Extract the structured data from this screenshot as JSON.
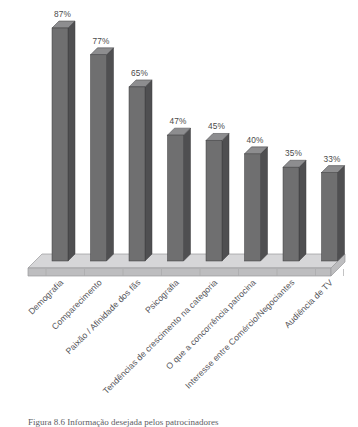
{
  "chart_data": {
    "type": "bar",
    "title": "",
    "subtitle": "",
    "xlabel": "",
    "ylabel": "",
    "ylim": [
      0,
      100
    ],
    "grid": false,
    "legend": false,
    "value_suffix": "%",
    "style": "3d-column",
    "categories": [
      "Demografia",
      "Comparecimento",
      "Paixão / Afinidade dos fãs",
      "Psicografia",
      "Tendências de crescimento na categoria",
      "O que a concorrência patrocina",
      "Interesse entre Comércio/Negociantes",
      "Audiência de TV"
    ],
    "values": [
      87,
      77,
      65,
      47,
      45,
      40,
      35,
      33
    ],
    "value_labels": [
      "87%",
      "77%",
      "65%",
      "47%",
      "45%",
      "40%",
      "35%",
      "33%"
    ],
    "colors": {
      "bar_front": "#6f6f70",
      "bar_side": "#4f4f51",
      "bar_top": "#8d8d8f",
      "floor_top": "#d6d6d8",
      "floor_front": "#bdbdbf",
      "floor_edge": "#9a9a9c",
      "background": "#ffffff",
      "label_text": "#4a4a4a",
      "category_text": "#55555a"
    }
  },
  "caption": {
    "text": "Figura 8.6 Informação desejada pelos patrocinadores"
  }
}
